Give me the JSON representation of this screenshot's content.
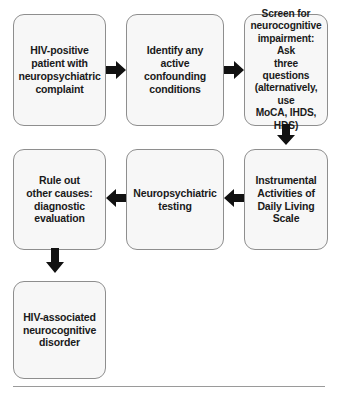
{
  "diagram": {
    "type": "flowchart",
    "background_color": "#ffffff",
    "node_fill_color": "#f7f7f7",
    "node_border_color": "#8e8e8e",
    "text_color": "#1a1a1a",
    "arrow_color": "#111111",
    "rule_color": "#9a9a9a",
    "nodes": [
      {
        "id": "node-hiv-positive-patient",
        "name": "hiv-positive-patient",
        "row": 1,
        "column": 1,
        "text": "HIV-positive\npatient with\nneuropsychiatric\ncomplaint"
      },
      {
        "id": "node-identify-confounding",
        "name": "identify-confounding-conditions",
        "row": 1,
        "column": 2,
        "text": "Identify any\nactive confounding\nconditions"
      },
      {
        "id": "node-screen-impairment",
        "name": "screen-neurocognitive-impairment",
        "row": 1,
        "column": 3,
        "text": "Screen for\nneurocognitive\nimpairment: Ask\nthree questions\n(alternatively, use\nMoCA, IHDS, HDS)"
      },
      {
        "id": "node-rule-out-causes",
        "name": "rule-out-other-causes",
        "row": 2,
        "column": 1,
        "text": "Rule out\nother causes:\ndiagnostic\nevaluation"
      },
      {
        "id": "node-neuropsychiatric-testing",
        "name": "neuropsychiatric-testing",
        "row": 2,
        "column": 2,
        "text": "Neuropsychiatric\ntesting"
      },
      {
        "id": "node-iadl-scale",
        "name": "instrumental-activities-daily-living-scale",
        "row": 2,
        "column": 3,
        "text": "Instrumental\nActivities of\nDaily Living\nScale"
      },
      {
        "id": "node-hand-diagnosis",
        "name": "hiv-associated-neurocognitive-disorder",
        "row": 3,
        "column": 1,
        "text": "HIV-associated\nneurocognitive\ndisorder"
      }
    ],
    "arrows": [
      {
        "id": "arrow-1",
        "name": "arrow-right-patient-to-identify",
        "direction": "right",
        "from": "node-hiv-positive-patient",
        "to": "node-identify-confounding"
      },
      {
        "id": "arrow-2",
        "name": "arrow-right-identify-to-screen",
        "direction": "right",
        "from": "node-identify-confounding",
        "to": "node-screen-impairment"
      },
      {
        "id": "arrow-3",
        "name": "arrow-down-screen-to-iadl",
        "direction": "down",
        "from": "node-screen-impairment",
        "to": "node-iadl-scale"
      },
      {
        "id": "arrow-4",
        "name": "arrow-left-iadl-to-testing",
        "direction": "left",
        "from": "node-iadl-scale",
        "to": "node-neuropsychiatric-testing"
      },
      {
        "id": "arrow-5",
        "name": "arrow-left-testing-to-rule-out",
        "direction": "left",
        "from": "node-neuropsychiatric-testing",
        "to": "node-rule-out-causes"
      },
      {
        "id": "arrow-6",
        "name": "arrow-down-rule-out-to-diagnosis",
        "direction": "down",
        "from": "node-rule-out-causes",
        "to": "node-hand-diagnosis"
      }
    ]
  }
}
